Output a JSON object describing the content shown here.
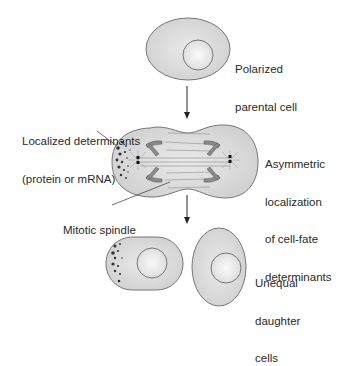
{
  "diagram": {
    "labels": {
      "parental_cell": [
        "Polarized",
        "parental cell"
      ],
      "localized_determinants": [
        "Localized determinants",
        "(protein or mRNA)"
      ],
      "asymmetric_localization": [
        "Asymmetric",
        "localization",
        "of cell-fate",
        "determinants"
      ],
      "mitotic_spindle": [
        "Mitotic spindle"
      ],
      "daughter_cells": [
        "Unequal",
        "daughter",
        "cells"
      ]
    },
    "stages": [
      "parental-cell",
      "dividing-cell",
      "daughter-cells"
    ],
    "colors": {
      "cell_fill": "#d6d6d6",
      "cell_outline": "#6a6a6a",
      "nucleus_fill": "#ececec",
      "chromosome": "#8a8a8a",
      "determinant_dots": "#3a3a3a",
      "arrow": "#222222"
    }
  }
}
